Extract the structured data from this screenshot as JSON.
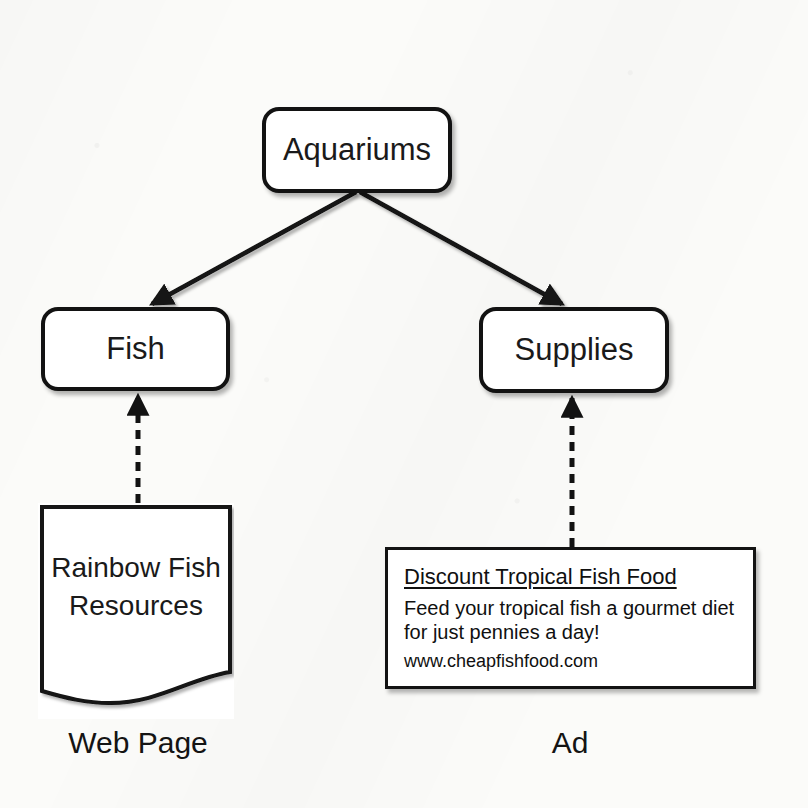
{
  "diagram": {
    "background_color": "#fbfbf9",
    "stroke_color": "#121212",
    "nodes": {
      "aquariums": {
        "label": "Aquariums",
        "shape": "rounded-rect"
      },
      "fish": {
        "label": "Fish",
        "shape": "rounded-rect"
      },
      "supplies": {
        "label": "Supplies",
        "shape": "rounded-rect"
      },
      "webpage": {
        "line1": "Rainbow Fish",
        "line2": "Resources",
        "shape": "document-wavy-bottom"
      },
      "ad": {
        "headline": "Discount Tropical Fish Food",
        "body_line1": "Feed your tropical fish a gourmet diet",
        "body_line2": "for just pennies a day!",
        "url": "www.cheapfishfood.com",
        "shape": "rect"
      }
    },
    "captions": {
      "webpage": "Web Page",
      "ad": "Ad"
    },
    "edges": [
      {
        "name": "entry-arrow",
        "from": "top",
        "to": "aquariums",
        "style": "solid"
      },
      {
        "name": "aquariums-to-fish",
        "from": "aquariums",
        "to": "fish",
        "style": "solid"
      },
      {
        "name": "aquariums-to-supplies",
        "from": "aquariums",
        "to": "supplies",
        "style": "solid"
      },
      {
        "name": "webpage-to-fish",
        "from": "webpage",
        "to": "fish",
        "style": "dashed"
      },
      {
        "name": "ad-to-supplies",
        "from": "ad",
        "to": "supplies",
        "style": "dashed"
      }
    ]
  }
}
